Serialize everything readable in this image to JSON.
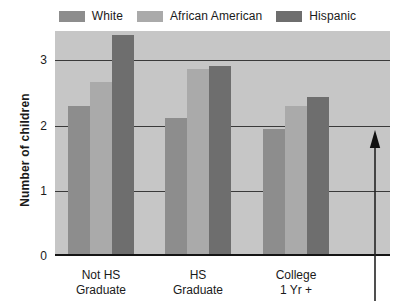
{
  "legend": {
    "entries": [
      {
        "label": "White",
        "color": "#8d8d8d",
        "swatch_name": "legend-swatch-white"
      },
      {
        "label": "African American",
        "color": "#aaaaaa",
        "swatch_name": "legend-swatch-african-american"
      },
      {
        "label": "Hispanic",
        "color": "#6e6e6e",
        "swatch_name": "legend-swatch-hispanic"
      }
    ]
  },
  "axes": {
    "y_title": "Number of children",
    "y_ticks": [
      "0",
      "1",
      "2",
      "3"
    ],
    "x_groups": [
      {
        "line1": "Not HS",
        "line2": "Graduate"
      },
      {
        "line1": "HS",
        "line2": "Graduate"
      },
      {
        "line1": "College",
        "line2": "1 Yr +"
      }
    ]
  },
  "annotation": {
    "arrow_name": "up-arrow-annotation",
    "direction": "up"
  },
  "colors": {
    "plot_background": "#c6c6c6",
    "gridline": "#3a3a3a",
    "axis": "#151515",
    "white_series": "#8d8d8d",
    "african_american_series": "#aaaaaa",
    "hispanic_series": "#6e6e6e"
  },
  "chart_data": {
    "type": "bar",
    "title": "",
    "xlabel": "",
    "ylabel": "Number of children",
    "ylim": [
      0,
      3.45
    ],
    "yticks": [
      0,
      1,
      2,
      3
    ],
    "grid": true,
    "legend_position": "top-center",
    "categories": [
      "Not HS Graduate",
      "HS Graduate",
      "College 1 Yr +"
    ],
    "series": [
      {
        "name": "White",
        "color": "#8d8d8d",
        "values": [
          2.28,
          2.1,
          1.93
        ]
      },
      {
        "name": "African American",
        "color": "#aaaaaa",
        "values": [
          2.65,
          2.85,
          2.28
        ]
      },
      {
        "name": "Hispanic",
        "color": "#6e6e6e",
        "values": [
          3.38,
          2.9,
          2.42
        ]
      }
    ],
    "annotations": [
      {
        "type": "arrow",
        "direction": "up",
        "x": "right of College 1 Yr + group"
      }
    ]
  }
}
